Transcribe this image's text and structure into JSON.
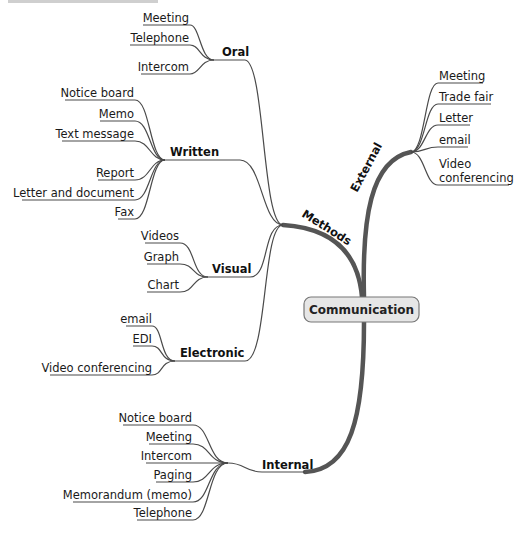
{
  "title_partial": "Communication",
  "center": {
    "label": "Communication",
    "fill": "#e6e6e6",
    "stroke": "#777777"
  },
  "main_branches": {
    "methods": {
      "label": "Methods"
    },
    "external": {
      "label": "External"
    },
    "internal": {
      "label": "Internal"
    }
  },
  "methods": {
    "oral": {
      "label": "Oral",
      "items": [
        "Meeting",
        "Telephone",
        "Intercom"
      ]
    },
    "written": {
      "label": "Written",
      "items": [
        "Notice board",
        "Memo",
        "Text message",
        "Report",
        "Letter and document",
        "Fax"
      ]
    },
    "visual": {
      "label": "Visual",
      "items": [
        "Videos",
        "Graph",
        "Chart"
      ]
    },
    "electronic": {
      "label": "Electronic",
      "items": [
        "email",
        "EDI",
        "Video conferencing"
      ]
    }
  },
  "external": {
    "items": [
      "Meeting",
      "Trade fair",
      "Letter",
      "email",
      "Video",
      "conferencing"
    ]
  },
  "internal": {
    "items": [
      "Notice board",
      "Meeting",
      "Intercom",
      "Paging",
      "Memorandum (memo)",
      "Telephone"
    ]
  }
}
